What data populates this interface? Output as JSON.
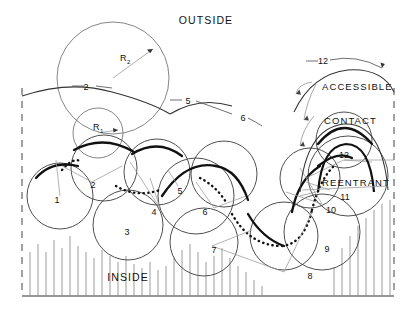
{
  "figure": {
    "title_top": "OUTSIDE",
    "title_bottom": "INSIDE",
    "surface_labels": {
      "accessible": "ACCESSIBLE",
      "contact": "CONTACT",
      "reentrant": "REENTRANT"
    },
    "radius_labels": {
      "probe": "R",
      "probe_sub": "1",
      "atom": "R",
      "atom_sub": "2"
    },
    "arc_callouts": [
      {
        "id": "arc-2",
        "label": "2"
      },
      {
        "id": "arc-5",
        "label": "5"
      },
      {
        "id": "arc-6",
        "label": "6"
      },
      {
        "id": "arc-12",
        "label": "12"
      }
    ],
    "accessible_center_label": "12",
    "atom_labels": [
      {
        "id": "atom-1",
        "label": "1"
      },
      {
        "id": "atom-2",
        "label": "2"
      },
      {
        "id": "atom-3",
        "label": "3"
      },
      {
        "id": "atom-4",
        "label": "4"
      },
      {
        "id": "atom-5",
        "label": "5"
      },
      {
        "id": "atom-6",
        "label": "6"
      },
      {
        "id": "atom-7",
        "label": "7"
      },
      {
        "id": "atom-8",
        "label": "8"
      },
      {
        "id": "atom-9",
        "label": "9"
      },
      {
        "id": "atom-10",
        "label": "10"
      },
      {
        "id": "atom-11",
        "label": "11"
      },
      {
        "id": "atom-12",
        "label": "12"
      }
    ],
    "colors": {
      "ink": "#111111",
      "thin": "#444444",
      "hatch": "#8a8a8a",
      "frame": "#555555",
      "background": "#ffffff"
    }
  }
}
